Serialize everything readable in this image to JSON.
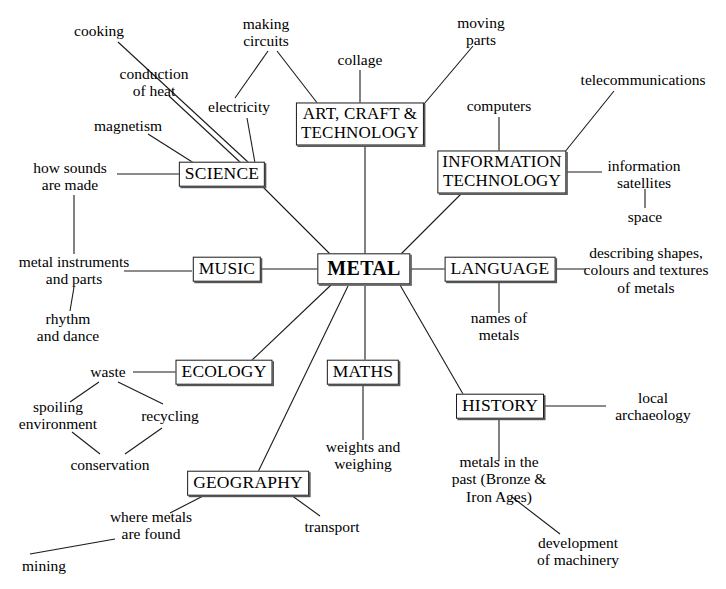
{
  "diagram": {
    "type": "mind-map",
    "background_color": "#ffffff",
    "line_color": "#1a1a1a",
    "text_color": "#000000"
  },
  "center": {
    "label": "METAL",
    "x": 364,
    "y": 269
  },
  "subjects": [
    {
      "id": "science",
      "label": "SCIENCE",
      "x": 222,
      "y": 174,
      "lines": 1
    },
    {
      "id": "art",
      "label": "ART, CRAFT &\nTECHNOLOGY",
      "x": 360,
      "y": 124,
      "lines": 2
    },
    {
      "id": "it",
      "label": "INFORMATION\nTECHNOLOGY",
      "x": 502,
      "y": 172,
      "lines": 2
    },
    {
      "id": "language",
      "label": "LANGUAGE",
      "x": 500,
      "y": 269,
      "lines": 1
    },
    {
      "id": "history",
      "label": "HISTORY",
      "x": 500,
      "y": 406,
      "lines": 1
    },
    {
      "id": "maths",
      "label": "MATHS",
      "x": 363,
      "y": 372,
      "lines": 1
    },
    {
      "id": "geography",
      "label": "GEOGRAPHY",
      "x": 248,
      "y": 483,
      "lines": 1
    },
    {
      "id": "ecology",
      "label": "ECOLOGY",
      "x": 224,
      "y": 372,
      "lines": 1
    },
    {
      "id": "music",
      "label": "MUSIC",
      "x": 227,
      "y": 269,
      "lines": 1
    }
  ],
  "leaves": [
    {
      "id": "cooking",
      "label": "cooking",
      "x": 99,
      "y": 31
    },
    {
      "id": "conduction",
      "label": "conduction\nof heat",
      "x": 154,
      "y": 82
    },
    {
      "id": "magnetism",
      "label": "magnetism",
      "x": 128,
      "y": 126
    },
    {
      "id": "how-sounds",
      "label": "how sounds\nare made",
      "x": 70,
      "y": 176
    },
    {
      "id": "making-circuits",
      "label": "making\ncircuits",
      "x": 266,
      "y": 32
    },
    {
      "id": "electricity",
      "label": "electricity",
      "x": 239,
      "y": 107
    },
    {
      "id": "collage",
      "label": "collage",
      "x": 360,
      "y": 60
    },
    {
      "id": "moving-parts",
      "label": "moving\nparts",
      "x": 481,
      "y": 31
    },
    {
      "id": "computers",
      "label": "computers",
      "x": 499,
      "y": 106
    },
    {
      "id": "telecommunications",
      "label": "telecommunications",
      "x": 643,
      "y": 80
    },
    {
      "id": "info-satellites",
      "label": "information\nsatellites",
      "x": 644,
      "y": 174
    },
    {
      "id": "space",
      "label": "space",
      "x": 645,
      "y": 217
    },
    {
      "id": "describing",
      "label": "describing shapes,\ncolours and textures\nof metals",
      "x": 646,
      "y": 270
    },
    {
      "id": "names-of-metals",
      "label": "names of\nmetals",
      "x": 499,
      "y": 326
    },
    {
      "id": "local-archaeology",
      "label": "local\narchaeology",
      "x": 653,
      "y": 406
    },
    {
      "id": "metals-past",
      "label": "metals in the\npast (Bronze &\nIron Ages)",
      "x": 499,
      "y": 479
    },
    {
      "id": "development",
      "label": "development\nof machinery",
      "x": 578,
      "y": 551
    },
    {
      "id": "weights",
      "label": "weights and\nweighing",
      "x": 363,
      "y": 455
    },
    {
      "id": "transport",
      "label": "transport",
      "x": 332,
      "y": 527
    },
    {
      "id": "where-metals",
      "label": "where metals\nare found",
      "x": 151,
      "y": 525
    },
    {
      "id": "mining",
      "label": "mining",
      "x": 44,
      "y": 566
    },
    {
      "id": "waste",
      "label": "waste",
      "x": 108,
      "y": 372
    },
    {
      "id": "spoiling",
      "label": "spoiling\nenvironment",
      "x": 58,
      "y": 415
    },
    {
      "id": "recycling",
      "label": "recycling",
      "x": 170,
      "y": 416
    },
    {
      "id": "conservation",
      "label": "conservation",
      "x": 110,
      "y": 465
    },
    {
      "id": "metal-instruments",
      "label": "metal instruments\nand parts",
      "x": 74,
      "y": 270
    },
    {
      "id": "rhythm",
      "label": "rhythm\nand dance",
      "x": 68,
      "y": 327
    }
  ],
  "edges": [
    {
      "from": "metal",
      "to": "science",
      "x1": 330,
      "y1": 254,
      "x2": 262,
      "y2": 186
    },
    {
      "from": "metal",
      "to": "art",
      "x1": 365,
      "y1": 254,
      "x2": 365,
      "y2": 145
    },
    {
      "from": "metal",
      "to": "it",
      "x1": 400,
      "y1": 255,
      "x2": 462,
      "y2": 193
    },
    {
      "from": "metal",
      "to": "language",
      "x1": 404,
      "y1": 269,
      "x2": 447,
      "y2": 269
    },
    {
      "from": "metal",
      "to": "history",
      "x1": 400,
      "y1": 285,
      "x2": 463,
      "y2": 394
    },
    {
      "from": "metal",
      "to": "maths",
      "x1": 365,
      "y1": 286,
      "x2": 365,
      "y2": 361
    },
    {
      "from": "metal",
      "to": "geography",
      "x1": 348,
      "y1": 286,
      "x2": 258,
      "y2": 472
    },
    {
      "from": "metal",
      "to": "ecology",
      "x1": 331,
      "y1": 285,
      "x2": 250,
      "y2": 362
    },
    {
      "from": "metal",
      "to": "music",
      "x1": 327,
      "y1": 269,
      "x2": 262,
      "y2": 269
    },
    {
      "from": "science",
      "to": "cooking",
      "x1": 249,
      "y1": 163,
      "x2": 118,
      "y2": 42
    },
    {
      "from": "science",
      "to": "conduction",
      "x1": 241,
      "y1": 163,
      "x2": 169,
      "y2": 96
    },
    {
      "from": "science",
      "to": "magnetism",
      "x1": 197,
      "y1": 165,
      "x2": 148,
      "y2": 134
    },
    {
      "from": "science",
      "to": "how-sounds",
      "x1": 182,
      "y1": 174,
      "x2": 117,
      "y2": 174
    },
    {
      "from": "science",
      "to": "electricity",
      "x1": 255,
      "y1": 163,
      "x2": 247,
      "y2": 118
    },
    {
      "from": "electricity",
      "to": "making-circuits",
      "x1": 235,
      "y1": 98,
      "x2": 268,
      "y2": 51
    },
    {
      "from": "art",
      "to": "making-circuits",
      "x1": 318,
      "y1": 104,
      "x2": 277,
      "y2": 51
    },
    {
      "from": "art",
      "to": "collage",
      "x1": 360,
      "y1": 104,
      "x2": 360,
      "y2": 70
    },
    {
      "from": "art",
      "to": "moving-parts",
      "x1": 424,
      "y1": 104,
      "x2": 473,
      "y2": 46
    },
    {
      "from": "it",
      "to": "computers",
      "x1": 499,
      "y1": 152,
      "x2": 499,
      "y2": 117
    },
    {
      "from": "it",
      "to": "telecommunications",
      "x1": 564,
      "y1": 153,
      "x2": 614,
      "y2": 91
    },
    {
      "from": "it",
      "to": "info-satellites",
      "x1": 567,
      "y1": 172,
      "x2": 602,
      "y2": 172
    },
    {
      "from": "info-satellites",
      "to": "space",
      "x1": 645,
      "y1": 189,
      "x2": 645,
      "y2": 208
    },
    {
      "from": "language",
      "to": "describing",
      "x1": 553,
      "y1": 269,
      "x2": 586,
      "y2": 269
    },
    {
      "from": "language",
      "to": "names-of-metals",
      "x1": 499,
      "y1": 281,
      "x2": 499,
      "y2": 313
    },
    {
      "from": "history",
      "to": "local-archaeology",
      "x1": 542,
      "y1": 406,
      "x2": 606,
      "y2": 406
    },
    {
      "from": "history",
      "to": "metals-past",
      "x1": 499,
      "y1": 418,
      "x2": 499,
      "y2": 461
    },
    {
      "from": "metals-past",
      "to": "development",
      "x1": 512,
      "y1": 497,
      "x2": 560,
      "y2": 534
    },
    {
      "from": "maths",
      "to": "weights",
      "x1": 363,
      "y1": 384,
      "x2": 363,
      "y2": 440
    },
    {
      "from": "geography",
      "to": "transport",
      "x1": 291,
      "y1": 495,
      "x2": 320,
      "y2": 516
    },
    {
      "from": "geography",
      "to": "where-metals",
      "x1": 205,
      "y1": 495,
      "x2": 170,
      "y2": 513
    },
    {
      "from": "where-metals",
      "to": "mining",
      "x1": 115,
      "y1": 539,
      "x2": 30,
      "y2": 554
    },
    {
      "from": "ecology",
      "to": "waste",
      "x1": 186,
      "y1": 372,
      "x2": 133,
      "y2": 372
    },
    {
      "from": "waste",
      "to": "spoiling",
      "x1": 99,
      "y1": 382,
      "x2": 70,
      "y2": 402
    },
    {
      "from": "waste",
      "to": "recycling",
      "x1": 118,
      "y1": 382,
      "x2": 163,
      "y2": 404
    },
    {
      "from": "spoiling",
      "to": "conservation",
      "x1": 72,
      "y1": 432,
      "x2": 100,
      "y2": 454
    },
    {
      "from": "recycling",
      "to": "conservation",
      "x1": 162,
      "y1": 428,
      "x2": 125,
      "y2": 454
    },
    {
      "from": "music",
      "to": "metal-instruments",
      "x1": 192,
      "y1": 271,
      "x2": 124,
      "y2": 271
    },
    {
      "from": "how-sounds",
      "to": "metal-instruments",
      "x1": 74,
      "y1": 195,
      "x2": 74,
      "y2": 254
    },
    {
      "from": "metal-instruments",
      "to": "rhythm",
      "x1": 74,
      "y1": 287,
      "x2": 70,
      "y2": 311
    }
  ]
}
